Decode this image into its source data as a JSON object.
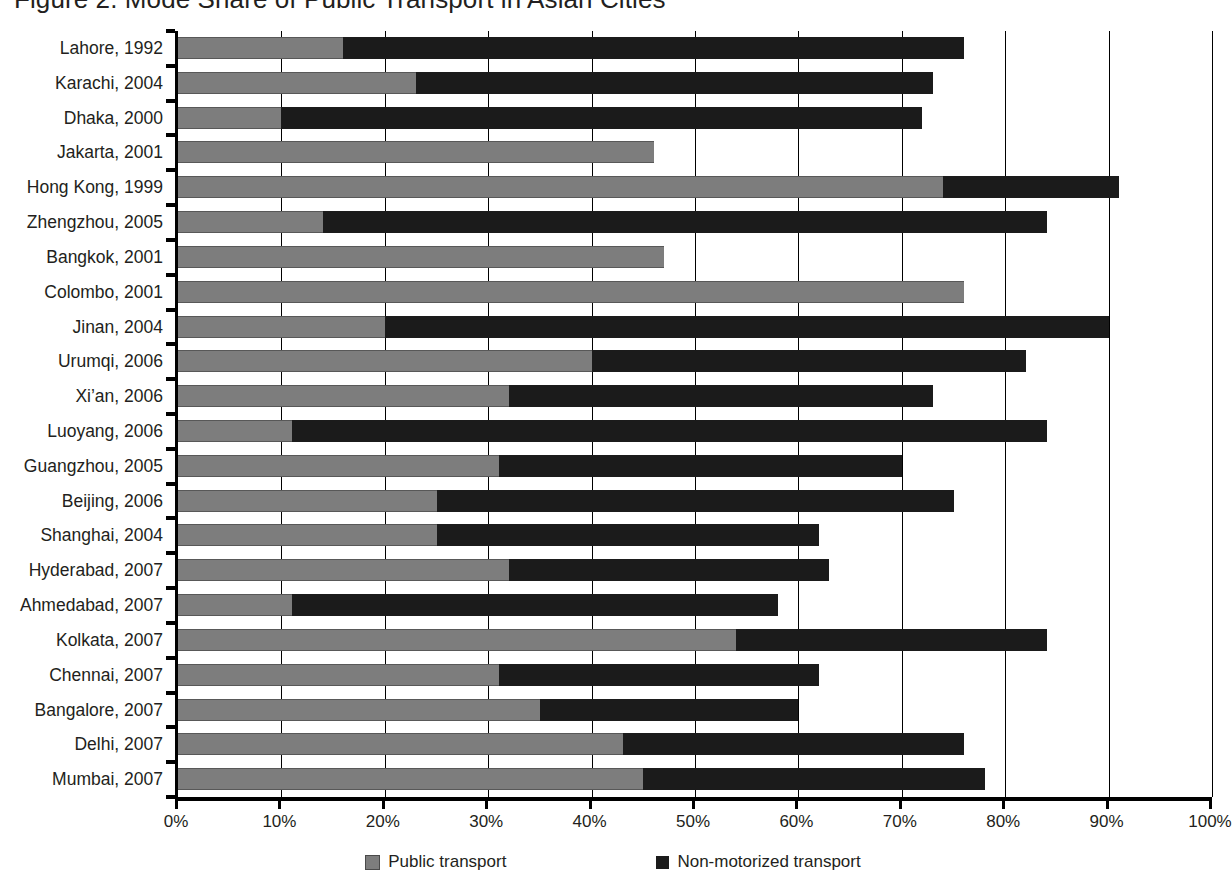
{
  "chart_data": {
    "type": "bar",
    "orientation": "horizontal",
    "stacked": true,
    "title": "Figure 2. Mode Share of Public Transport in Asian Cities",
    "xlabel": "",
    "ylabel": "",
    "xlim": [
      0,
      100
    ],
    "grid": true,
    "legend_position": "bottom",
    "tick_labels": [
      "0%",
      "10%",
      "20%",
      "30%",
      "40%",
      "50%",
      "60%",
      "70%",
      "80%",
      "90%",
      "100%"
    ],
    "tick_values": [
      0,
      10,
      20,
      30,
      40,
      50,
      60,
      70,
      80,
      90,
      100
    ],
    "categories": [
      "Lahore, 1992",
      "Karachi, 2004",
      "Dhaka, 2000",
      "Jakarta, 2001",
      "Hong Kong, 1999",
      "Zhengzhou, 2005",
      "Bangkok, 2001",
      "Colombo, 2001",
      "Jinan, 2004",
      "Urumqi, 2006",
      "Xi’an, 2006",
      "Luoyang, 2006",
      "Guangzhou, 2005",
      "Beijing, 2006",
      "Shanghai, 2004",
      "Hyderabad, 2007",
      "Ahmedabad, 2007",
      "Kolkata, 2007",
      "Chennai, 2007",
      "Bangalore, 2007",
      "Delhi, 2007",
      "Mumbai, 2007"
    ],
    "series": [
      {
        "name": "Public transport",
        "color": "#7d7d7d",
        "values": [
          16,
          23,
          10,
          46,
          74,
          14,
          47,
          76,
          20,
          40,
          32,
          11,
          31,
          25,
          25,
          32,
          11,
          54,
          31,
          35,
          43,
          45
        ]
      },
      {
        "name": "Non-motorized transport",
        "color": "#1b1b1b",
        "values": [
          60,
          50,
          62,
          0,
          17,
          70,
          0,
          0,
          70,
          42,
          41,
          73,
          39,
          50,
          37,
          31,
          47,
          30,
          31,
          25,
          33,
          33
        ]
      }
    ],
    "totals": [
      76,
      73,
      72,
      46,
      91,
      84,
      47,
      76,
      90,
      82,
      73,
      84,
      70,
      75,
      62,
      63,
      58,
      84,
      62,
      60,
      76,
      78
    ]
  },
  "legend": {
    "items": [
      {
        "label": "Public transport",
        "swatch": "public"
      },
      {
        "label": "Non-motorized transport",
        "swatch": "nmt"
      }
    ]
  }
}
